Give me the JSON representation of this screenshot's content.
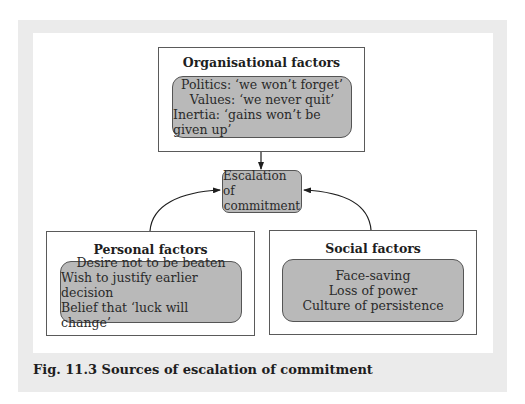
{
  "figure": {
    "caption": "Fig. 11.3  Sources of escalation of commitment",
    "center": {
      "lines": [
        "Escalation of",
        "commitment"
      ]
    },
    "organisational": {
      "title": "Organisational factors",
      "items": [
        "Politics: ‘we won’t forget’",
        "Values: ‘we never quit’",
        "Inertia: ‘gains won’t be given up’"
      ]
    },
    "personal": {
      "title": "Personal factors",
      "items": [
        "Desire not to be beaten",
        "Wish to justify earlier decision",
        "Belief that ‘luck will change’"
      ]
    },
    "social": {
      "title": "Social factors",
      "items": [
        "Face-saving",
        "Loss of power",
        "Culture of persistence"
      ]
    },
    "colors": {
      "panel_bg": "#ebebeb",
      "box_fill": "#b9b9b9",
      "border": "#555555"
    }
  }
}
